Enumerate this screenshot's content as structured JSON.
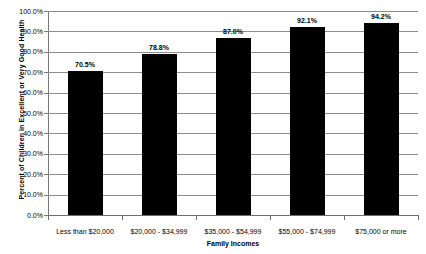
{
  "chart_data": {
    "type": "bar",
    "title": "",
    "xlabel": "Family Incomes",
    "ylabel": "Percent of Children in Excellent or Very Good Health",
    "categories": [
      "Less than $20,000",
      "$20,000 - $34,999",
      "$35,000 - $54,999",
      "$55,000 - $74,999",
      "$75,000 or more"
    ],
    "values": [
      70.5,
      78.8,
      87.0,
      92.1,
      94.2
    ],
    "data_labels": [
      "70.5%",
      "78.8%",
      "87.0%",
      "92.1%",
      "94.2%"
    ],
    "ylim": [
      0,
      100
    ],
    "ytick_labels": [
      "100.0%",
      "90.0%",
      "80.0%",
      "70.0%",
      "60.0%",
      "50.0%",
      "40.0%",
      "30.0%",
      "20.0%",
      "10.0%",
      "0.0%"
    ],
    "ytick_values": [
      100,
      90,
      80,
      70,
      60,
      50,
      40,
      30,
      20,
      10,
      0
    ],
    "grid": true,
    "legend": false,
    "bar_color": "#000000",
    "gridline_color": "#8c8c8c",
    "background_color": "#ffffff"
  }
}
